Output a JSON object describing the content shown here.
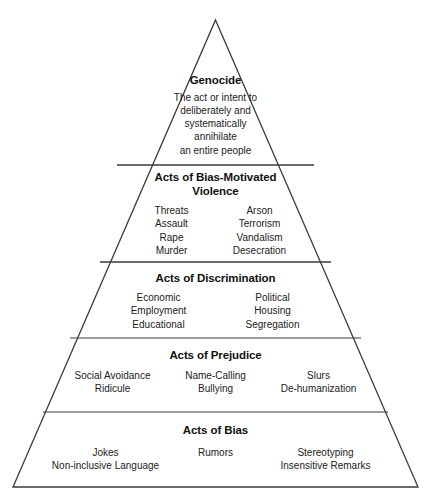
{
  "diagram": {
    "shape": "pyramid",
    "stroke_color": "#3a3a3a",
    "text_color": "#1a1a1a",
    "background": "#ffffff",
    "caption": "",
    "tiers": [
      {
        "id": "genocide",
        "level": 5,
        "title": "Genocide",
        "layout": "lines",
        "lines": [
          "The act or intent to",
          "deliberately and",
          "systematically",
          "annihilate",
          "an entire people"
        ]
      },
      {
        "id": "violence",
        "level": 4,
        "title_line_1": "Acts of Bias-Motivated",
        "title_line_2": "Violence",
        "title": "Acts of Bias-Motivated Violence",
        "layout": "columns",
        "columns": [
          [
            "Threats",
            "Assault",
            "Rape",
            "Murder"
          ],
          [
            "Arson",
            "Terrorism",
            "Vandalism",
            "Desecration"
          ]
        ]
      },
      {
        "id": "discrimination",
        "level": 3,
        "title": "Acts of Discrimination",
        "layout": "columns",
        "columns": [
          [
            "Economic",
            "Employment",
            "Educational"
          ],
          [
            "Political",
            "Housing",
            "Segregation"
          ]
        ]
      },
      {
        "id": "prejudice",
        "level": 2,
        "title": "Acts of Prejudice",
        "layout": "columns",
        "columns": [
          [
            "Social Avoidance",
            "Ridicule"
          ],
          [
            "Name-Calling",
            "Bullying"
          ],
          [
            "Slurs",
            "De-humanization"
          ]
        ]
      },
      {
        "id": "bias",
        "level": 1,
        "title": "Acts of Bias",
        "layout": "columns",
        "columns": [
          [
            "Jokes",
            "Non-inclusive Language"
          ],
          [
            "Rumors",
            ""
          ],
          [
            "Stereotyping",
            "Insensitive Remarks"
          ]
        ]
      }
    ]
  }
}
